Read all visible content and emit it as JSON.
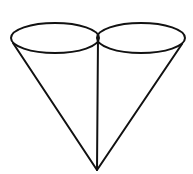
{
  "diagram": {
    "type": "geometric-figure",
    "stroke_color": "#111111",
    "background": "#ffffff",
    "shapes": {
      "left_base": {
        "cx": 55,
        "cy": 38,
        "rx": 44,
        "ry": 15
      },
      "right_base": {
        "cx": 141,
        "cy": 38,
        "rx": 44,
        "ry": 15
      },
      "apex": {
        "x": 97,
        "y": 170
      },
      "left_slant": {
        "x1": 13,
        "y1": 43,
        "x2": 97,
        "y2": 170
      },
      "right_slant": {
        "x1": 182,
        "y1": 44,
        "x2": 97,
        "y2": 170
      },
      "shared_edge": {
        "x1": 98,
        "y1": 38,
        "x2": 97,
        "y2": 170
      }
    }
  }
}
